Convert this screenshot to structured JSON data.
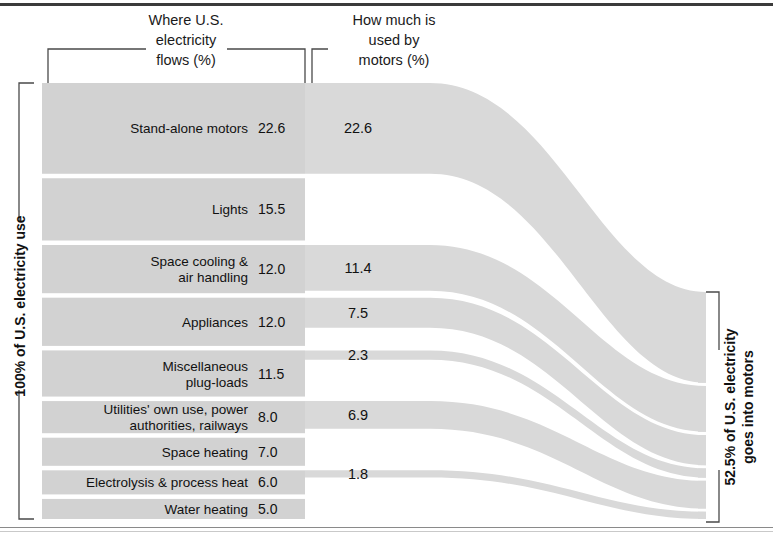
{
  "chart_data": {
    "type": "sankey",
    "unit": "percent",
    "headers": {
      "left": [
        "Where U.S.",
        "electricity",
        "flows (%)"
      ],
      "right": [
        "How much is",
        "used by",
        "motors (%)"
      ]
    },
    "left_axis_label": "100% of U.S. electricity use",
    "right_axis_label_lines": [
      "52.5% of U.S. electricity",
      "goes into motors"
    ],
    "total_left": 100.0,
    "total_motors": 52.5,
    "categories": [
      {
        "label_lines": [
          "Stand-alone motors"
        ],
        "flow": 22.6,
        "motors": 22.6,
        "motors_label": "22.6"
      },
      {
        "label_lines": [
          "Lights"
        ],
        "flow": 15.5,
        "motors": 0,
        "motors_label": ""
      },
      {
        "label_lines": [
          "Space cooling &",
          "air handling"
        ],
        "flow": 12.0,
        "motors": 11.4,
        "motors_label": "11.4"
      },
      {
        "label_lines": [
          "Appliances"
        ],
        "flow": 12.0,
        "motors": 7.5,
        "motors_label": "7.5"
      },
      {
        "label_lines": [
          "Miscellaneous",
          "plug-loads"
        ],
        "flow": 11.5,
        "motors": 2.3,
        "motors_label": "2.3"
      },
      {
        "label_lines": [
          "Utilities' own use, power",
          "authorities, railways"
        ],
        "flow": 8.0,
        "motors": 6.9,
        "motors_label": "6.9"
      },
      {
        "label_lines": [
          "Space heating"
        ],
        "flow": 7.0,
        "motors": 0,
        "motors_label": ""
      },
      {
        "label_lines": [
          "Electrolysis & process heat"
        ],
        "flow": 6.0,
        "motors": 1.8,
        "motors_label": "1.8"
      },
      {
        "label_lines": [
          "Water heating"
        ],
        "flow": 5.0,
        "motors": 0,
        "motors_label": ""
      }
    ],
    "flow_values_text": [
      "22.6",
      "15.5",
      "12.0",
      "12.0",
      "11.5",
      "8.0",
      "7.0",
      "6.0",
      "5.0"
    ],
    "motor_values_text": [
      "22.6",
      "11.4",
      "7.5",
      "2.3",
      "6.9",
      "1.8"
    ],
    "colors": {
      "band": "#d2d2d2",
      "band_light": "#d9d9d9",
      "text": "#111111",
      "rule": "#3b3b3b",
      "bracket": "#4a4a4a",
      "background": "#ffffff"
    }
  }
}
